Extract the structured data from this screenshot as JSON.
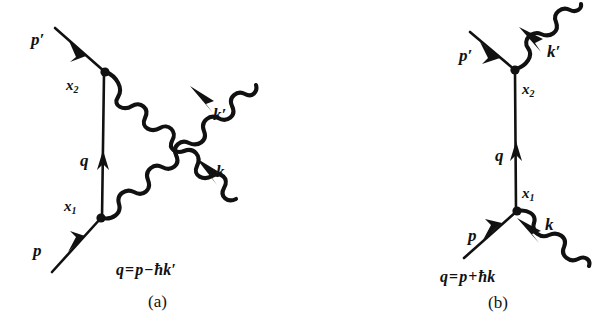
{
  "figure": {
    "background_color": "#ffffff",
    "ink_color": "#111111",
    "type": "feynman-diagram-pair"
  },
  "diagrams": [
    {
      "id": "a",
      "caption": "(a)",
      "equation": {
        "lhs": "q",
        "equals": "=",
        "term1": "p",
        "operator": "−",
        "hbar": "ħ",
        "term2": "k′",
        "full": "q = p − ħk′"
      },
      "labels": {
        "p_out": "p′",
        "p_in": "p",
        "q": "q",
        "x1": "x",
        "x1_sub": "1",
        "x2": "x",
        "x2_sub": "2",
        "k_out": "k′",
        "k_in": "k"
      },
      "vertices": [
        {
          "name": "x1",
          "x": 101,
          "y": 218
        },
        {
          "name": "x2",
          "x": 105,
          "y": 72
        }
      ],
      "lines": [
        {
          "name": "outgoing-electron",
          "kind": "fermion",
          "label": "p′"
        },
        {
          "name": "incoming-electron",
          "kind": "fermion",
          "label": "p"
        },
        {
          "name": "virtual-electron",
          "kind": "fermion",
          "label": "q"
        },
        {
          "name": "outgoing-photon",
          "kind": "photon",
          "label": "k′"
        },
        {
          "name": "incoming-photon",
          "kind": "photon",
          "label": "k"
        }
      ]
    },
    {
      "id": "b",
      "caption": "(b)",
      "equation": {
        "lhs": "q",
        "equals": "=",
        "term1": "p",
        "operator": "+",
        "hbar": "ħ",
        "term2": "k",
        "full": "q = p + ħk"
      },
      "labels": {
        "p_out": "p′",
        "p_in": "p",
        "q": "q",
        "x1": "x",
        "x1_sub": "1",
        "x2": "x",
        "x2_sub": "2",
        "k_out": "k′",
        "k_in": "k"
      },
      "vertices": [
        {
          "name": "x1",
          "x": 517,
          "y": 211
        },
        {
          "name": "x2",
          "x": 515,
          "y": 70
        }
      ],
      "lines": [
        {
          "name": "outgoing-electron",
          "kind": "fermion",
          "label": "p′"
        },
        {
          "name": "incoming-electron",
          "kind": "fermion",
          "label": "p"
        },
        {
          "name": "virtual-electron",
          "kind": "fermion",
          "label": "q"
        },
        {
          "name": "outgoing-photon",
          "kind": "photon",
          "label": "k′"
        },
        {
          "name": "incoming-photon",
          "kind": "photon",
          "label": "k"
        }
      ]
    }
  ]
}
